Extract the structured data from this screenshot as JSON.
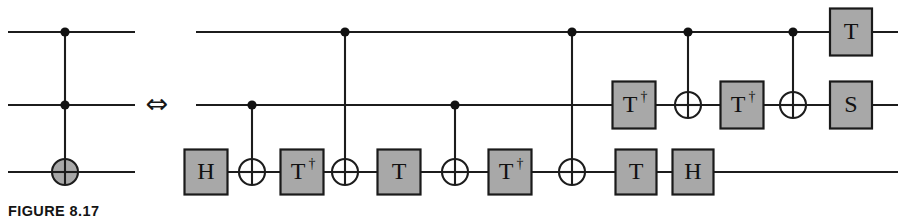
{
  "figure": {
    "caption": "FIGURE 8.17",
    "equivalence_symbol": "⇔"
  },
  "left_circuit": {
    "name": "toffoli-gate",
    "wires": [
      {
        "id": "top",
        "y": 32,
        "x1": 8,
        "x2": 135
      },
      {
        "id": "middle",
        "y": 105,
        "x1": 8,
        "x2": 135
      },
      {
        "id": "bottom",
        "y": 172,
        "x1": 8,
        "x2": 135
      }
    ],
    "elements": [
      {
        "kind": "control",
        "x": 65,
        "wire": "top"
      },
      {
        "kind": "control",
        "x": 65,
        "wire": "middle"
      },
      {
        "kind": "target_filled",
        "x": 65,
        "wire": "bottom"
      },
      {
        "kind": "vline",
        "x": 65,
        "y1": 32,
        "y2": 172
      }
    ]
  },
  "right_circuit": {
    "name": "toffoli-decomposition",
    "wires": [
      {
        "id": "top",
        "y": 32,
        "x1": 196,
        "x2": 898
      },
      {
        "id": "middle",
        "y": 105,
        "x1": 196,
        "x2": 898
      },
      {
        "id": "bottom",
        "y": 172,
        "x1": 196,
        "x2": 898
      }
    ],
    "gates": [
      {
        "label": "H",
        "x": 206,
        "wire": "bottom",
        "w": 43,
        "h": 45
      },
      {
        "label": "T†",
        "x": 302,
        "wire": "bottom",
        "w": 43,
        "h": 45
      },
      {
        "label": "T",
        "x": 399,
        "wire": "bottom",
        "w": 43,
        "h": 45
      },
      {
        "label": "T†",
        "x": 510,
        "wire": "bottom",
        "w": 43,
        "h": 45
      },
      {
        "label": "T",
        "x": 636,
        "wire": "bottom",
        "w": 41,
        "h": 45
      },
      {
        "label": "H",
        "x": 693,
        "wire": "bottom",
        "w": 41,
        "h": 45
      },
      {
        "label": "T†",
        "x": 634,
        "wire": "middle",
        "w": 43,
        "h": 47
      },
      {
        "label": "T†",
        "x": 742,
        "wire": "middle",
        "w": 43,
        "h": 47
      },
      {
        "label": "S",
        "x": 851,
        "wire": "middle",
        "w": 42,
        "h": 47
      },
      {
        "label": "T",
        "x": 851,
        "wire": "top",
        "w": 42,
        "h": 47
      }
    ],
    "cnots": [
      {
        "control_wire": "middle",
        "target_wire": "bottom",
        "x": 252
      },
      {
        "control_wire": "top",
        "target_wire": "bottom",
        "x": 345
      },
      {
        "control_wire": "middle",
        "target_wire": "bottom",
        "x": 455
      },
      {
        "control_wire": "top",
        "target_wire": "bottom",
        "x": 572
      },
      {
        "control_wire": "top",
        "target_wire": "middle",
        "x": 688
      },
      {
        "control_wire": "top",
        "target_wire": "middle",
        "x": 793
      }
    ]
  },
  "style": {
    "gate_fill": "#a8a8a8",
    "gate_stroke": "#1a1a1a",
    "wire_color": "#1c1c1c",
    "background": "#ffffff",
    "target_fill_left": "#a8a8a8",
    "target_fill_right": "#ffffff"
  },
  "geometry": {
    "target_radius": 13,
    "control_radius": 4.6,
    "gate_font_size": 24,
    "dagger_font_size": 14,
    "equiv_x": 157,
    "equiv_y": 105,
    "equiv_font_size": 27
  }
}
